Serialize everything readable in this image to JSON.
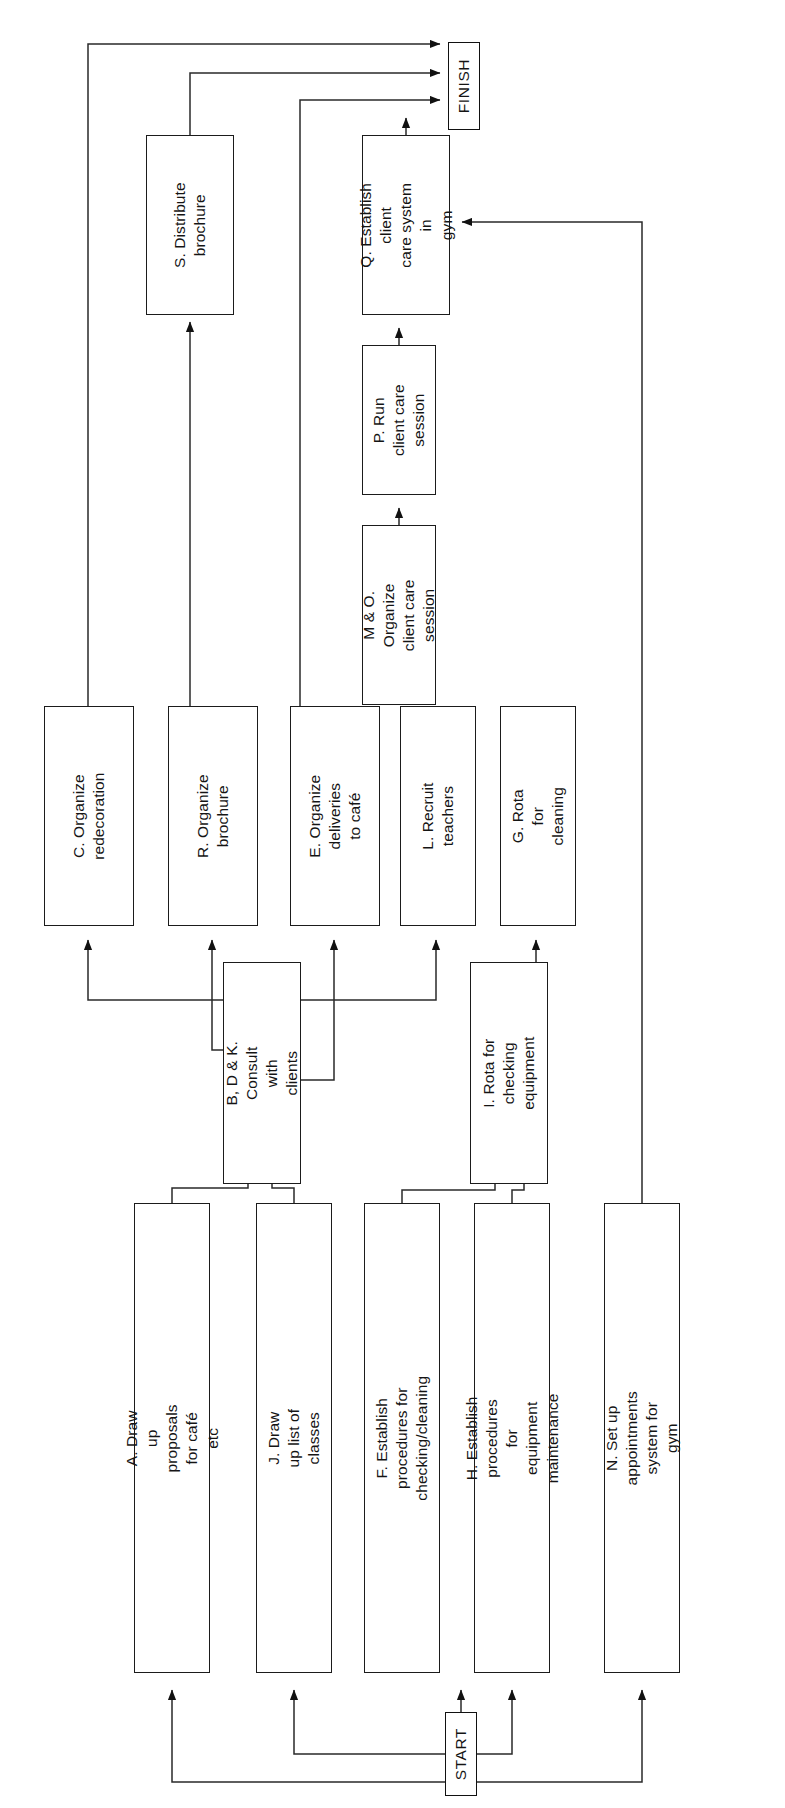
{
  "diagram": {
    "orientation": "rotated-90-ccw",
    "terminals": {
      "start_label": "START",
      "finish_label": "FINISH"
    },
    "nodes": [
      {
        "id": "FINISH",
        "label": "FINISH",
        "x": 448,
        "y": 42,
        "w": 32,
        "h": 88,
        "kind": "terminal"
      },
      {
        "id": "S",
        "label": "S. Distribute brochure",
        "x": 146,
        "y": 135,
        "w": 88,
        "h": 180,
        "kind": "task"
      },
      {
        "id": "Q",
        "label": "Q. Establish client\ncare system in\ngym",
        "x": 362,
        "y": 135,
        "w": 88,
        "h": 180,
        "kind": "task"
      },
      {
        "id": "P",
        "label": "P. Run client care\nsession",
        "x": 362,
        "y": 345,
        "w": 74,
        "h": 150,
        "kind": "task"
      },
      {
        "id": "M_O",
        "label": "M & O. Organize\nclient care session",
        "x": 362,
        "y": 525,
        "w": 74,
        "h": 180,
        "kind": "task"
      },
      {
        "id": "C",
        "label": "C. Organize\nredecoration",
        "x": 44,
        "y": 706,
        "w": 90,
        "h": 220,
        "kind": "task"
      },
      {
        "id": "R",
        "label": "R. Organize\nbrochure",
        "x": 168,
        "y": 706,
        "w": 90,
        "h": 220,
        "kind": "task"
      },
      {
        "id": "E",
        "label": "E. Organize deliveries\nto café",
        "x": 290,
        "y": 706,
        "w": 90,
        "h": 220,
        "kind": "task"
      },
      {
        "id": "L",
        "label": "L. Recruit teachers",
        "x": 400,
        "y": 706,
        "w": 76,
        "h": 220,
        "kind": "task"
      },
      {
        "id": "G",
        "label": "G. Rota for cleaning",
        "x": 500,
        "y": 706,
        "w": 76,
        "h": 220,
        "kind": "task"
      },
      {
        "id": "B_D_K",
        "label": "B, D & K. Consult with\nclients",
        "x": 223,
        "y": 962,
        "w": 78,
        "h": 222,
        "kind": "task"
      },
      {
        "id": "I",
        "label": "I. Rota for checking\nequipment",
        "x": 470,
        "y": 962,
        "w": 78,
        "h": 222,
        "kind": "task"
      },
      {
        "id": "A",
        "label": "A. Draw up\nproposals for café etc",
        "x": 134,
        "y": 1203,
        "w": 76,
        "h": 470,
        "kind": "task"
      },
      {
        "id": "J",
        "label": "J. Draw up list of\nclasses",
        "x": 256,
        "y": 1203,
        "w": 76,
        "h": 470,
        "kind": "task"
      },
      {
        "id": "F",
        "label": "F. Establish\nprocedures for\nchecking/cleaning",
        "x": 364,
        "y": 1203,
        "w": 76,
        "h": 470,
        "kind": "task"
      },
      {
        "id": "H",
        "label": "H. Establish procedures\nfor equipment\nmaintenance",
        "x": 474,
        "y": 1203,
        "w": 76,
        "h": 470,
        "kind": "task"
      },
      {
        "id": "N",
        "label": "N. Set up appointments\nsystem for gym",
        "x": 604,
        "y": 1203,
        "w": 76,
        "h": 470,
        "kind": "task"
      },
      {
        "id": "START",
        "label": "START",
        "x": 445,
        "y": 1712,
        "w": 32,
        "h": 84,
        "kind": "terminal"
      }
    ],
    "edges": [
      {
        "from": "START",
        "to": "A"
      },
      {
        "from": "START",
        "to": "J"
      },
      {
        "from": "START",
        "to": "F"
      },
      {
        "from": "START",
        "to": "H"
      },
      {
        "from": "START",
        "to": "N"
      },
      {
        "from": "A",
        "to": "B_D_K"
      },
      {
        "from": "J",
        "to": "B_D_K"
      },
      {
        "from": "F",
        "to": "I"
      },
      {
        "from": "H",
        "to": "I"
      },
      {
        "from": "B_D_K",
        "to": "C"
      },
      {
        "from": "B_D_K",
        "to": "R"
      },
      {
        "from": "B_D_K",
        "to": "E"
      },
      {
        "from": "B_D_K",
        "to": "L"
      },
      {
        "from": "I",
        "to": "G"
      },
      {
        "from": "L",
        "to": "M_O"
      },
      {
        "from": "M_O",
        "to": "P"
      },
      {
        "from": "P",
        "to": "Q"
      },
      {
        "from": "N",
        "to": "Q"
      },
      {
        "from": "R",
        "to": "S"
      },
      {
        "from": "Q",
        "to": "FINISH"
      },
      {
        "from": "C",
        "to": "FINISH"
      },
      {
        "from": "S",
        "to": "FINISH"
      },
      {
        "from": "E",
        "to": "FINISH"
      }
    ]
  }
}
